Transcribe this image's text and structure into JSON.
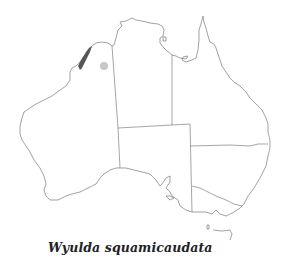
{
  "map": {
    "region": "Australia",
    "range_color": "#555555",
    "record_color": "#c8c8c8",
    "outline_color": "#7a7a7a",
    "features": [
      {
        "type": "range-polygon",
        "label": "distribution range"
      },
      {
        "type": "point-record",
        "label": "isolated record"
      }
    ]
  },
  "caption": {
    "species": "Wyulda squamicaudata"
  }
}
